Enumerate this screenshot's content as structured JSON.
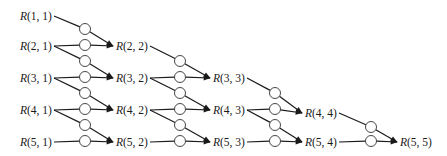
{
  "diagram": {
    "type": "romberg-dependency-graph",
    "colors": {
      "line": "#1a1a1a",
      "node_fill": "#ffffff",
      "background": "#ffffff"
    },
    "nodes": [
      {
        "id": "R11",
        "label": "R(1, 1)",
        "x": 20,
        "y": 16
      },
      {
        "id": "R21",
        "label": "R(2, 1)",
        "x": 20,
        "y": 46
      },
      {
        "id": "R31",
        "label": "R(3, 1)",
        "x": 20,
        "y": 78
      },
      {
        "id": "R41",
        "label": "R(4, 1)",
        "x": 20,
        "y": 110
      },
      {
        "id": "R51",
        "label": "R(5, 1)",
        "x": 20,
        "y": 142
      },
      {
        "id": "R22",
        "label": "R(2, 2)",
        "x": 116,
        "y": 46
      },
      {
        "id": "R32",
        "label": "R(3, 2)",
        "x": 116,
        "y": 78
      },
      {
        "id": "R42",
        "label": "R(4, 2)",
        "x": 116,
        "y": 110
      },
      {
        "id": "R52",
        "label": "R(5, 2)",
        "x": 116,
        "y": 142
      },
      {
        "id": "R33",
        "label": "R(3, 3)",
        "x": 213,
        "y": 78
      },
      {
        "id": "R43",
        "label": "R(4, 3)",
        "x": 213,
        "y": 110
      },
      {
        "id": "R53",
        "label": "R(5, 3)",
        "x": 213,
        "y": 142
      },
      {
        "id": "R44",
        "label": "R(4, 4)",
        "x": 305,
        "y": 113
      },
      {
        "id": "R54",
        "label": "R(5, 4)",
        "x": 305,
        "y": 142
      },
      {
        "id": "R55",
        "label": "R(5, 5)",
        "x": 400,
        "y": 142
      }
    ],
    "edges": [
      {
        "from": "R11",
        "to": "R22",
        "circle": [
          85,
          29
        ]
      },
      {
        "from": "R21",
        "to": "R22",
        "circle": [
          85,
          45
        ]
      },
      {
        "from": "R21",
        "to": "R32",
        "circle": [
          85,
          61
        ]
      },
      {
        "from": "R31",
        "to": "R32",
        "circle": [
          85,
          77
        ]
      },
      {
        "from": "R31",
        "to": "R42",
        "circle": [
          85,
          93
        ]
      },
      {
        "from": "R41",
        "to": "R42",
        "circle": [
          85,
          109
        ]
      },
      {
        "from": "R41",
        "to": "R52",
        "circle": [
          85,
          125
        ]
      },
      {
        "from": "R51",
        "to": "R52",
        "circle": [
          85,
          141
        ]
      },
      {
        "from": "R22",
        "to": "R33",
        "circle": [
          180,
          61
        ]
      },
      {
        "from": "R32",
        "to": "R33",
        "circle": [
          180,
          77
        ]
      },
      {
        "from": "R32",
        "to": "R43",
        "circle": [
          180,
          93
        ]
      },
      {
        "from": "R42",
        "to": "R43",
        "circle": [
          180,
          109
        ]
      },
      {
        "from": "R42",
        "to": "R53",
        "circle": [
          180,
          125
        ]
      },
      {
        "from": "R52",
        "to": "R53",
        "circle": [
          180,
          141
        ]
      },
      {
        "from": "R33",
        "to": "R44",
        "circle": [
          275,
          93
        ]
      },
      {
        "from": "R43",
        "to": "R44",
        "circle": [
          275,
          109
        ]
      },
      {
        "from": "R43",
        "to": "R54",
        "circle": [
          275,
          125
        ]
      },
      {
        "from": "R53",
        "to": "R54",
        "circle": [
          275,
          141
        ]
      },
      {
        "from": "R44",
        "to": "R55",
        "circle": [
          371,
          127
        ]
      },
      {
        "from": "R54",
        "to": "R55",
        "circle": [
          371,
          141
        ]
      }
    ]
  }
}
